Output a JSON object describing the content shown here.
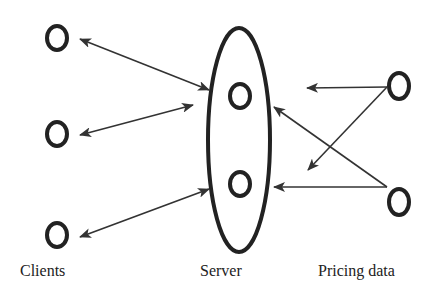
{
  "diagram": {
    "type": "client-server-architecture",
    "labels": {
      "clients": "Clients",
      "server": "Server",
      "pricing": "Pricing data"
    },
    "nodes": {
      "clients": [
        "client-1",
        "client-2",
        "client-3"
      ],
      "server_nodes": [
        "server-node-1",
        "server-node-2"
      ],
      "pricing_sources": [
        "pricing-source-1",
        "pricing-source-2"
      ]
    },
    "edges": [
      {
        "from": "client-1",
        "to": "server",
        "direction": "bidirectional"
      },
      {
        "from": "client-2",
        "to": "server",
        "direction": "bidirectional"
      },
      {
        "from": "client-3",
        "to": "server",
        "direction": "bidirectional"
      },
      {
        "from": "pricing-source-1",
        "to": "server-node-1",
        "direction": "one-way"
      },
      {
        "from": "pricing-source-1",
        "to": "server-node-2",
        "direction": "one-way"
      },
      {
        "from": "pricing-source-2",
        "to": "server-node-1",
        "direction": "one-way"
      },
      {
        "from": "pricing-source-2",
        "to": "server-node-2",
        "direction": "one-way"
      }
    ],
    "colors": {
      "stroke": "#222222",
      "background": "#ffffff"
    }
  }
}
